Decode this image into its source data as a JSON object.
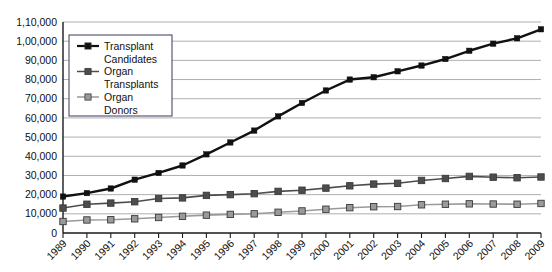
{
  "chart_data": {
    "type": "line",
    "title": "",
    "xlabel": "",
    "ylabel": "",
    "grid": true,
    "legend_position": "top-left",
    "x": [
      "1989",
      "1990",
      "1991",
      "1992",
      "1993",
      "1994",
      "1995",
      "1996",
      "1997",
      "1998",
      "1999",
      "2000",
      "2001",
      "2002",
      "2003",
      "2004",
      "2005",
      "2006",
      "2007",
      "2008",
      "2009"
    ],
    "ylim": [
      0,
      110000
    ],
    "ytick_values": [
      0,
      10000,
      20000,
      30000,
      40000,
      50000,
      60000,
      70000,
      80000,
      90000,
      100000,
      110000
    ],
    "ytick_labels": [
      "0",
      "10,000",
      "20,000",
      "30,000",
      "40,000",
      "50,000",
      "60,000",
      "70,000",
      "80,000",
      "90,000",
      "1,00,000",
      "1,10,000"
    ],
    "series": [
      {
        "name": "Transplant Candidates",
        "color": "#111111",
        "marker": "square",
        "values": [
          19000,
          20800,
          23200,
          27800,
          31300,
          35200,
          41000,
          47200,
          53400,
          60800,
          67800,
          74300,
          80000,
          81200,
          84300,
          87300,
          90700,
          95000,
          98700,
          101500,
          106200
        ]
      },
      {
        "name": "Organ Transplants",
        "color": "#4d4d4d",
        "marker": "square",
        "values": [
          13000,
          15000,
          15600,
          16300,
          18000,
          18300,
          19600,
          20000,
          20500,
          21700,
          22300,
          23400,
          24600,
          25500,
          25900,
          27400,
          28400,
          29500,
          29100,
          28800,
          29200
        ]
      },
      {
        "name": "Organ Donors",
        "color": "#9a9a9a",
        "marker": "square",
        "values": [
          6000,
          6800,
          6900,
          7400,
          8100,
          8700,
          9300,
          9700,
          10000,
          10800,
          11500,
          12400,
          13200,
          13700,
          13800,
          14700,
          15000,
          15200,
          15100,
          15000,
          15400
        ]
      }
    ]
  },
  "legend": {
    "items": [
      {
        "label_line1": "Transplant",
        "label_line2": "Candidates"
      },
      {
        "label_line1": "Organ",
        "label_line2": "Transplants"
      },
      {
        "label_line1": "Organ",
        "label_line2": "Donors"
      }
    ]
  }
}
